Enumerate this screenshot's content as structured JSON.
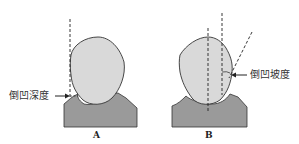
{
  "diagram": {
    "panels": [
      {
        "id": "A",
        "caption": "A",
        "label": "倒凹深度",
        "label_meaning": "undercut depth",
        "elements": [
          "tooth-crown",
          "gum-base",
          "vertical-dashed-line",
          "arrow"
        ]
      },
      {
        "id": "B",
        "caption": "B",
        "label": "倒凹坡度",
        "label_meaning": "undercut slope",
        "elements": [
          "tooth-crown",
          "gum-base",
          "center-dashed-line",
          "vertical-dashed-line",
          "slanted-dashed-line",
          "angle-arc",
          "arrow"
        ]
      }
    ],
    "colors": {
      "crown_fill": "#d9d9d9",
      "base_fill": "#9a9a9a",
      "outline": "#333333",
      "dash": "#222222"
    }
  }
}
